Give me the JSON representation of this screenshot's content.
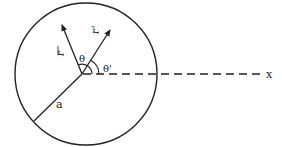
{
  "diagram": {
    "labels": {
      "vector_r": "r",
      "vector_r_prime": "r'",
      "angle_theta": "θ",
      "angle_theta_prime": "θ'",
      "radius": "a",
      "axis": "x"
    },
    "colors": {
      "stroke": "#222222",
      "background": "#ffffff"
    }
  }
}
